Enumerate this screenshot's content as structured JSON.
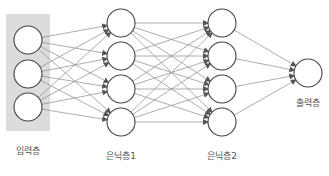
{
  "diagram": {
    "type": "neural-network",
    "colors": {
      "input_box": "#dcdcdc",
      "node_stroke": "#444444",
      "node_fill": "#ffffff",
      "edge": "#8a8a8a",
      "label": "#555555"
    },
    "layers": [
      {
        "id": "input",
        "label": "입력층",
        "nodes": 3
      },
      {
        "id": "hidden1",
        "label": "은닉층1",
        "nodes": 4
      },
      {
        "id": "hidden2",
        "label": "은닉층2",
        "nodes": 4
      },
      {
        "id": "output",
        "label": "출력층",
        "nodes": 1
      }
    ],
    "connections": "fully-connected with arrowheads between successive layers"
  }
}
